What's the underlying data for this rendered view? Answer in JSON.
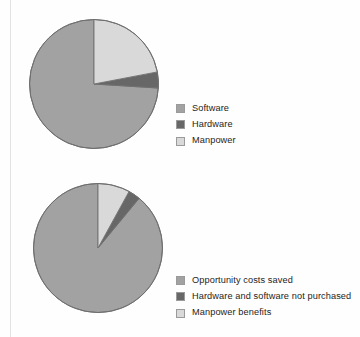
{
  "colors": {
    "slice_main": "#a2a2a2",
    "slice_dark": "#676767",
    "slice_light": "#d9d9d9",
    "outline": "#6f6f6f",
    "swatch_border": "#9a9a9a",
    "background": "#ffffff",
    "rule": "#e2e2e2",
    "text": "#231f20"
  },
  "chart_data": [
    {
      "type": "pie",
      "id": "costs-pie",
      "title": "",
      "legend_position": "right",
      "start_angle_deg": 90,
      "direction": "counterclockwise",
      "categories": [
        "Software",
        "Hardware",
        "Manpower"
      ],
      "values": [
        74,
        4,
        22
      ],
      "unit": "percent",
      "slice_colors": [
        "#a2a2a2",
        "#676767",
        "#d9d9d9"
      ],
      "legend": [
        {
          "label": "Software",
          "color": "#a2a2a2"
        },
        {
          "label": "Hardware",
          "color": "#676767"
        },
        {
          "label": "Manpower",
          "color": "#d9d9d9"
        }
      ]
    },
    {
      "type": "pie",
      "id": "benefits-pie",
      "title": "",
      "legend_position": "right",
      "start_angle_deg": 90,
      "direction": "counterclockwise",
      "categories": [
        "Opportunity costs saved",
        "Hardware and software not purchased",
        "Manpower benefits"
      ],
      "values": [
        89,
        3,
        8
      ],
      "unit": "percent",
      "slice_colors": [
        "#a2a2a2",
        "#676767",
        "#d9d9d9"
      ],
      "legend": [
        {
          "label": "Opportunity costs saved",
          "color": "#a2a2a2"
        },
        {
          "label": "Hardware and software not purchased",
          "color": "#676767"
        },
        {
          "label": "Manpower benefits",
          "color": "#d9d9d9"
        }
      ]
    }
  ]
}
